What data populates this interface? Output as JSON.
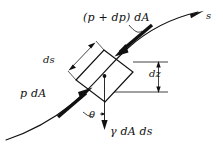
{
  "figure": {
    "background_color": "#ffffff",
    "stroke_color": "#111111",
    "labels": {
      "pressure_top": "(p + dp) dA",
      "pressure_left": "p dA",
      "weight": "γ dA ds",
      "length_ds": "ds",
      "height_dz": "dz",
      "angle_theta": "θ",
      "streamline_s": "s"
    },
    "icons": {
      "streamline": "streamline-curve",
      "element": "fluid-element-rectangle",
      "centroid": "center-dot",
      "arrow_top": "pressure-force-arrow-top",
      "arrow_left": "pressure-force-arrow-left",
      "arrow_weight": "gravity-force-arrow",
      "arrow_s": "streamline-direction-arrow",
      "dim_ds": "ds-dimension-line",
      "dim_dz": "dz-dimension-line",
      "angle_marker": "theta-angle-arc"
    }
  }
}
